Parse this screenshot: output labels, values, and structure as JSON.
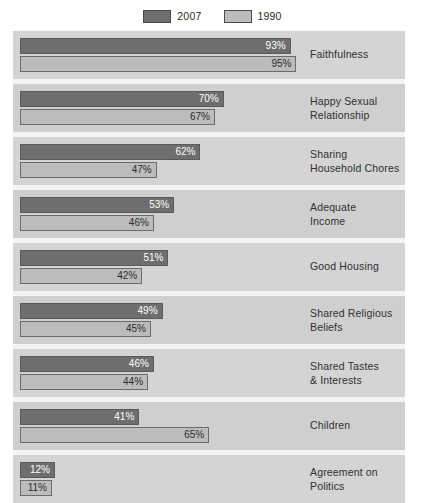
{
  "legend": {
    "entries": [
      {
        "label": "2007",
        "color": "#6e6e6e",
        "swatch_name": "legend-swatch-2007"
      },
      {
        "label": "1990",
        "color": "#bcbcbc",
        "swatch_name": "legend-swatch-1990"
      }
    ]
  },
  "chart_data": {
    "type": "bar",
    "orientation": "horizontal",
    "title": "",
    "subtitle": "",
    "xlabel": "",
    "ylabel": "",
    "xlim": [
      0,
      100
    ],
    "grid": false,
    "legend_position": "top-center",
    "value_suffix": "%",
    "categories": [
      "Faithfulness",
      "Happy Sexual Relationship",
      "Sharing Household Chores",
      "Adequate Income",
      "Good Housing",
      "Shared Religious Beliefs",
      "Shared Tastes & Interests",
      "Children",
      "Agreement on Politics"
    ],
    "series": [
      {
        "name": "2007",
        "color": "#6e6e6e",
        "values": [
          93,
          70,
          62,
          53,
          51,
          49,
          46,
          41,
          12
        ]
      },
      {
        "name": "1990",
        "color": "#bcbcbc",
        "values": [
          95,
          67,
          47,
          46,
          42,
          45,
          44,
          65,
          11
        ]
      }
    ],
    "rows": [
      {
        "label_line1": "Faithfulness",
        "label_line2": "",
        "v2007": 93,
        "v1990": 95,
        "t2007": "93%",
        "t1990": "95%"
      },
      {
        "label_line1": "Happy Sexual",
        "label_line2": "Relationship",
        "v2007": 70,
        "v1990": 67,
        "t2007": "70%",
        "t1990": "67%"
      },
      {
        "label_line1": "Sharing",
        "label_line2": "Household Chores",
        "v2007": 62,
        "v1990": 47,
        "t2007": "62%",
        "t1990": "47%"
      },
      {
        "label_line1": "Adequate",
        "label_line2": "Income",
        "v2007": 53,
        "v1990": 46,
        "t2007": "53%",
        "t1990": "46%"
      },
      {
        "label_line1": "Good Housing",
        "label_line2": "",
        "v2007": 51,
        "v1990": 42,
        "t2007": "51%",
        "t1990": "42%"
      },
      {
        "label_line1": "Shared Religious",
        "label_line2": "Beliefs",
        "v2007": 49,
        "v1990": 45,
        "t2007": "49%",
        "t1990": "45%"
      },
      {
        "label_line1": "Shared Tastes",
        "label_line2": "& Interests",
        "v2007": 46,
        "v1990": 44,
        "t2007": "46%",
        "t1990": "44%"
      },
      {
        "label_line1": "Children",
        "label_line2": "",
        "v2007": 41,
        "v1990": 65,
        "t2007": "41%",
        "t1990": "65%"
      },
      {
        "label_line1": "Agreement on",
        "label_line2": "Politics",
        "v2007": 12,
        "v1990": 11,
        "t2007": "12%",
        "t1990": "11%"
      }
    ]
  },
  "colors": {
    "panel_background": "#d4d4d4",
    "row_separator": "#f4f4f4",
    "bar_2007": "#6e6e6e",
    "bar_1990": "#bcbcbc",
    "bar_outline": "#5a5a5a",
    "text": "#2f2f2f",
    "axis_spine": "#9a9a9a"
  }
}
